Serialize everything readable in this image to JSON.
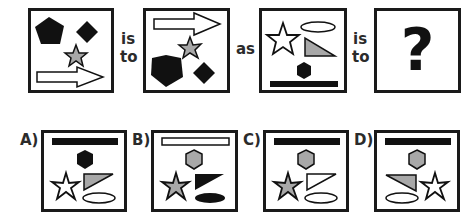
{
  "question": {
    "connectors": {
      "is": "is",
      "to": "to",
      "as": "as",
      "is2": "is",
      "to2": "to"
    },
    "unknown_symbol": "?",
    "panels": [
      {
        "id": "panel-1",
        "shapes": [
          "black-pentagon",
          "black-diamond",
          "gray-star",
          "white-arrow"
        ]
      },
      {
        "id": "panel-2",
        "shapes": [
          "white-arrow",
          "gray-star",
          "black-pentagon",
          "black-diamond"
        ]
      },
      {
        "id": "panel-3",
        "shapes": [
          "white-star",
          "white-ellipse",
          "gray-triangle",
          "black-hexagon",
          "black-bar"
        ]
      },
      {
        "id": "panel-4",
        "shapes": [
          "question-mark"
        ]
      }
    ]
  },
  "options": [
    {
      "label": "A)",
      "shapes": [
        "black-bar",
        "black-hexagon",
        "white-star",
        "gray-triangle",
        "white-ellipse"
      ]
    },
    {
      "label": "B)",
      "shapes": [
        "white-bar",
        "gray-hexagon",
        "gray-star",
        "black-triangle",
        "black-ellipse"
      ]
    },
    {
      "label": "C)",
      "shapes": [
        "black-bar",
        "gray-hexagon",
        "gray-star",
        "white-triangle",
        "white-ellipse"
      ]
    },
    {
      "label": "D)",
      "shapes": [
        "black-bar",
        "gray-hexagon",
        "gray-triangle",
        "white-star",
        "white-ellipse"
      ]
    }
  ],
  "colors": {
    "black": "#111111",
    "gray": "#a8a8a8",
    "white": "#ffffff",
    "border": "#1a1a1a"
  }
}
